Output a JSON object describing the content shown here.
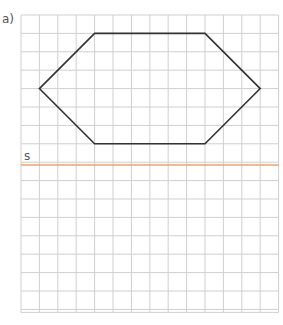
{
  "exercise_label": "a)",
  "axis_label": "s",
  "grid": {
    "cols": 14,
    "rows": 16,
    "x0": 21,
    "y0": 15,
    "cell": 18.4,
    "color": "#cfcfcf"
  },
  "hexagon": {
    "points_grid": [
      [
        1,
        4
      ],
      [
        4,
        1
      ],
      [
        10,
        1
      ],
      [
        13,
        4
      ],
      [
        10,
        7
      ],
      [
        4,
        7
      ]
    ],
    "color": "#333333"
  },
  "symmetry_axis": {
    "row_y": 165,
    "color": "#f0a070"
  }
}
